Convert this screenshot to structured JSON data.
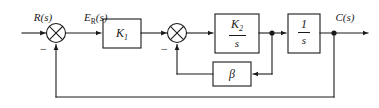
{
  "diagram": {
    "type": "control-system-block-diagram",
    "line_color": "#1a1a1a",
    "background_color": "#ffffff",
    "signals": {
      "input": "R(s)",
      "input_base": "R",
      "error": "E",
      "error_subscript": "R",
      "error_suffix": "(s)",
      "output": "C(s)",
      "output_base": "C"
    },
    "blocks": [
      {
        "id": "gain-k1",
        "label": "K",
        "subscript": "1",
        "kind": "gain",
        "x": 103,
        "y": 19,
        "w": 38,
        "h": 29
      },
      {
        "id": "integrator-k2-s",
        "label_numerator": "K",
        "label_numerator_sub": "2",
        "label_denominator": "s",
        "kind": "transfer-function",
        "x": 215,
        "y": 14,
        "w": 44,
        "h": 39
      },
      {
        "id": "integrator-1-s",
        "label_numerator": "1",
        "label_denominator": "s",
        "kind": "transfer-function",
        "x": 288,
        "y": 14,
        "w": 32,
        "h": 39
      },
      {
        "id": "feedback-beta",
        "label": "β",
        "kind": "gain",
        "x": 213,
        "y": 62,
        "w": 38,
        "h": 24
      }
    ],
    "summing_junctions": [
      {
        "id": "summing-junction-outer",
        "symbol": "×",
        "sign_label": "−",
        "cx": 56,
        "cy": 33,
        "r": 9.5
      },
      {
        "id": "summing-junction-inner",
        "symbol": "×",
        "sign_label": "−",
        "cx": 177,
        "cy": 33,
        "r": 9.5
      }
    ],
    "takeoff_points": [
      {
        "id": "takeoff-after-k2s",
        "cx": 272,
        "cy": 33
      },
      {
        "id": "takeoff-after-1s",
        "cx": 334,
        "cy": 33
      }
    ],
    "loops": [
      {
        "id": "inner-feedback-loop",
        "from": "takeoff-after-k2s",
        "through": "feedback-beta",
        "to": "summing-junction-inner",
        "sign": "−"
      },
      {
        "id": "outer-feedback-loop",
        "from": "takeoff-after-1s",
        "to": "summing-junction-outer",
        "sign": "−"
      }
    ]
  }
}
